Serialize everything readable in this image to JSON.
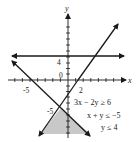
{
  "diagram": {
    "type": "system-of-linear-inequalities-graph",
    "axes": {
      "x_label": "x",
      "y_label": "y",
      "x_tick_labels": [
        "-5",
        "2"
      ],
      "y_tick_labels": [
        "4",
        "0",
        "-5"
      ]
    },
    "inequalities": [
      "3x − 2y ≥ 6",
      "x + y ≤ −5",
      "y ≤ 4"
    ],
    "boundary_lines": [
      {
        "equation": "3x − 2y = 6",
        "style": "solid"
      },
      {
        "equation": "x + y = −5",
        "style": "solid"
      },
      {
        "equation": "y = 4",
        "style": "solid"
      }
    ],
    "shaded_region": {
      "description": "region below the intersection of 3x − 2y = 6 and x + y = −5",
      "vertex": "(-0.8, -4.2)",
      "color": "#c8c8c8"
    },
    "colors": {
      "line": "#1a1a1a",
      "shade": "#c8c8c8",
      "background": "#ffffff"
    }
  }
}
